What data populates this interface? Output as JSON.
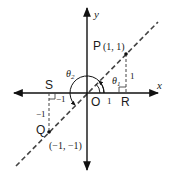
{
  "diagram": {
    "type": "coordinate-geometry",
    "axes": {
      "x_label": "x",
      "y_label": "y",
      "origin_label": "O"
    },
    "points": {
      "P": {
        "name": "P",
        "coords": "(1, 1)"
      },
      "Q": {
        "name": "Q",
        "coords": "(−1, −1)"
      },
      "R": {
        "name": "R"
      },
      "S": {
        "name": "S"
      }
    },
    "lengths": {
      "OR": "1",
      "PR": "1",
      "SO": "−1",
      "QS": "−1"
    },
    "angles": {
      "theta1": {
        "symbol": "θ",
        "sub": "1"
      },
      "theta2": {
        "symbol": "θ",
        "sub": "2"
      }
    },
    "line": "dashed line y = x through O"
  }
}
